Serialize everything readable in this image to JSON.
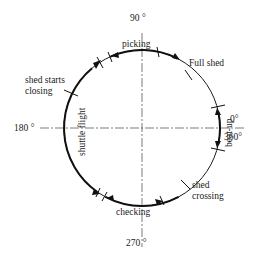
{
  "diagram": {
    "center": {
      "x": 142,
      "y": 128
    },
    "radius": 78,
    "angles": {
      "top": "90 °",
      "left": "180 °",
      "right_top": "0°",
      "right_bottom": "360°",
      "bottom": "270 °"
    },
    "phases": {
      "picking": "picking",
      "full_shed": "Full shed",
      "beat_up": "beat-up",
      "shed_crossing_line1": "shed",
      "shed_crossing_line2": "crossing",
      "checking": "checking",
      "shuttle_flight": "shuttle flight",
      "shed_starts_closing_line1": "shed starts",
      "shed_starts_closing_line2": "closing"
    },
    "colors": {
      "line": "#111111",
      "axis": "#444444",
      "background": "#ffffff"
    }
  }
}
